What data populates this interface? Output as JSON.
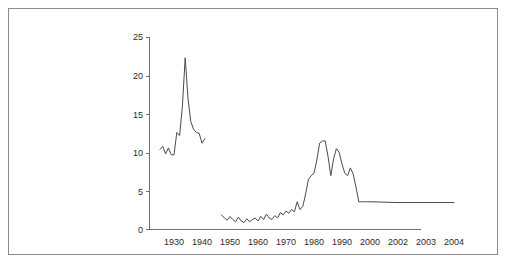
{
  "figure": {
    "border_color": "#8c8c8c",
    "background": "#ffffff"
  },
  "chart_data": {
    "type": "line",
    "title": "",
    "xlabel": "",
    "ylabel": "",
    "ylim": [
      0,
      25
    ],
    "grid": false,
    "legend": null,
    "line_color": "#4a4a4a",
    "axis_color": "#6e6e6e",
    "y_ticks": [
      0,
      5,
      10,
      15,
      20,
      25
    ],
    "y_tick_labels": [
      "0",
      "5",
      "10",
      "15",
      "20",
      "25"
    ],
    "x_tick_labels": [
      "1930",
      "1940",
      "1950",
      "1960",
      "1970",
      "1980",
      "1990",
      "2000",
      "2002",
      "2003",
      "2004"
    ],
    "x_axis_note": "irregular scale: decades 1930-2000 then individual years 2002, 2003, 2004",
    "series": [
      {
        "name": "early-segment",
        "x": [
          1925,
          1926,
          1927,
          1928,
          1929,
          1930,
          1931,
          1932,
          1933,
          1934,
          1935,
          1936,
          1937,
          1938,
          1939,
          1940,
          1941
        ],
        "values": [
          10.4,
          10.8,
          9.8,
          10.6,
          9.7,
          9.7,
          12.6,
          12.2,
          16.0,
          22.3,
          17.0,
          14.0,
          13.0,
          12.6,
          12.5,
          11.2,
          11.8
        ]
      },
      {
        "name": "late-segment",
        "x": [
          1947,
          1948,
          1949,
          1950,
          1951,
          1952,
          1953,
          1954,
          1955,
          1956,
          1957,
          1958,
          1959,
          1960,
          1961,
          1962,
          1963,
          1964,
          1965,
          1966,
          1967,
          1968,
          1969,
          1970,
          1971,
          1972,
          1973,
          1974,
          1975,
          1976,
          1977,
          1978,
          1979,
          1980,
          1981,
          1982,
          1983,
          1984,
          1985,
          1986,
          1987,
          1988,
          1989,
          1990,
          1991,
          1992,
          1993,
          1994,
          1995,
          1996,
          1997,
          1998,
          1999,
          2000,
          2002,
          2003,
          2004
        ],
        "values": [
          1.9,
          1.5,
          1.2,
          1.7,
          1.3,
          1.0,
          1.6,
          1.1,
          0.9,
          1.4,
          1.0,
          1.3,
          1.5,
          1.1,
          1.7,
          1.3,
          2.0,
          1.5,
          1.3,
          1.8,
          1.5,
          2.2,
          1.9,
          2.4,
          2.1,
          2.6,
          2.3,
          3.6,
          2.6,
          3.0,
          4.6,
          6.5,
          7.0,
          7.3,
          9.0,
          11.2,
          11.5,
          11.5,
          9.5,
          7.0,
          9.2,
          10.5,
          10.0,
          8.5,
          7.3,
          7.0,
          8.0,
          7.2,
          5.5,
          3.6,
          3.6,
          3.6,
          3.6,
          3.6,
          3.5,
          3.5,
          3.5
        ]
      }
    ]
  }
}
